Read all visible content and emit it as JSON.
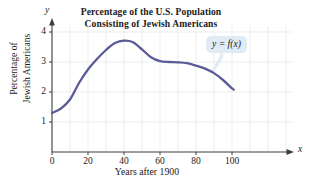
{
  "figure": {
    "title_line1": "Percentage of the U.S. Population",
    "title_line2": "Consisting of Jewish Americans",
    "x_axis_title": "Years after 1900",
    "y_axis_title_line1": "Percentage of",
    "y_axis_title_line2": "Jewish Americans",
    "x_axis_letter": "x",
    "y_axis_letter": "y",
    "callout_label": "y = f(x)"
  },
  "colors": {
    "curve": "#5b5b97",
    "grid": "#e6e6e6",
    "axis": "#3c3c3c",
    "callout_bg": "#e1ebf4",
    "text": "#1a1a1a"
  },
  "chart_data": {
    "type": "line",
    "title": "Percentage of the U.S. Population Consisting of Jewish Americans",
    "xlabel": "Years after 1900",
    "ylabel": "Percentage of Jewish Americans",
    "xlim": [
      0,
      115
    ],
    "ylim": [
      0,
      4.4
    ],
    "xticks": [
      0,
      20,
      40,
      60,
      80,
      100
    ],
    "yticks": [
      1,
      2,
      3,
      4
    ],
    "grid": true,
    "grid_x_step": 10,
    "grid_y_step": 1,
    "legend": "y = f(x)",
    "legend_position": "inside-upper-right",
    "series": [
      {
        "name": "y = f(x)",
        "x": [
          0,
          5,
          10,
          15,
          20,
          25,
          30,
          35,
          40,
          45,
          50,
          55,
          60,
          65,
          70,
          75,
          80,
          85,
          90,
          95,
          100,
          101
        ],
        "values": [
          1.3,
          1.45,
          1.75,
          2.3,
          2.75,
          3.1,
          3.4,
          3.63,
          3.71,
          3.66,
          3.42,
          3.16,
          3.03,
          3.0,
          2.99,
          2.96,
          2.88,
          2.78,
          2.63,
          2.4,
          2.12,
          2.08
        ]
      }
    ]
  }
}
